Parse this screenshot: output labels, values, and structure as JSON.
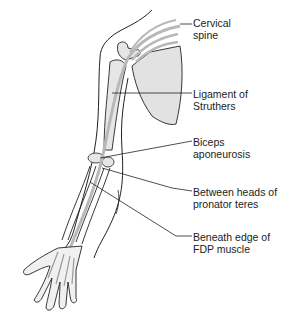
{
  "figure": {
    "colors": {
      "line": "#222222",
      "nerve": "#b8b8b8",
      "bone_fill": "#e6e6e6",
      "scapula_fill": "#e2e2e2"
    }
  },
  "labels": [
    {
      "id": "cervical-spine",
      "line1": "Cervical",
      "line2": "spine",
      "x": 193,
      "y": 17
    },
    {
      "id": "ligament-of-struthers",
      "line1": "Ligament of",
      "line2": "Struthers",
      "x": 193,
      "y": 88
    },
    {
      "id": "biceps-aponeurosis",
      "line1": "Biceps",
      "line2": "aponeurosis",
      "x": 193,
      "y": 136
    },
    {
      "id": "pronator-teres",
      "line1": "Between heads of",
      "line2": "pronator teres",
      "x": 193,
      "y": 186
    },
    {
      "id": "fdp-muscle",
      "line1": "Beneath edge of",
      "line2": "FDP muscle",
      "x": 193,
      "y": 231
    }
  ]
}
